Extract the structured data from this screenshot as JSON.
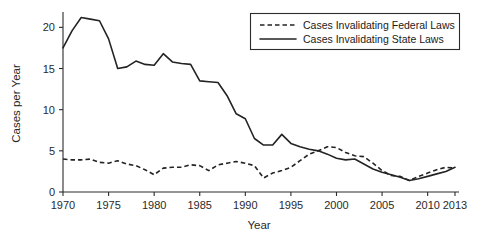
{
  "chart_data": {
    "type": "line",
    "title": "",
    "xlabel": "Year",
    "ylabel": "Cases per Year",
    "xlim": [
      1970,
      2013
    ],
    "ylim": [
      0,
      21.5
    ],
    "grid": false,
    "legend_position": "top-right",
    "x": [
      1970,
      1971,
      1972,
      1973,
      1974,
      1975,
      1976,
      1977,
      1978,
      1979,
      1980,
      1981,
      1982,
      1983,
      1984,
      1985,
      1986,
      1987,
      1988,
      1989,
      1990,
      1991,
      1992,
      1993,
      1994,
      1995,
      1996,
      1997,
      1998,
      1999,
      2000,
      2001,
      2002,
      2003,
      2004,
      2005,
      2006,
      2007,
      2008,
      2009,
      2010,
      2011,
      2012,
      2013
    ],
    "xticks": [
      1970,
      1975,
      1980,
      1985,
      1990,
      1995,
      2000,
      2005,
      2010,
      2013
    ],
    "xtick_labels": [
      "1970",
      "1975",
      "1980",
      "1985",
      "1990",
      "1995",
      "2000",
      "2005",
      "2010",
      "2013"
    ],
    "yticks": [
      0,
      5,
      10,
      15,
      20
    ],
    "ytick_labels": [
      "0",
      "5",
      "10",
      "15",
      "20"
    ],
    "series": [
      {
        "name": "Cases Invalidating Federal Laws",
        "style": "dashed",
        "values": [
          4.0,
          3.9,
          3.9,
          4.0,
          3.6,
          3.5,
          3.8,
          3.4,
          3.2,
          2.7,
          2.1,
          2.9,
          3.0,
          3.0,
          3.3,
          3.2,
          2.6,
          3.3,
          3.5,
          3.7,
          3.5,
          3.2,
          1.7,
          2.3,
          2.6,
          3.0,
          3.8,
          4.6,
          5.0,
          5.5,
          5.4,
          4.8,
          4.4,
          4.3,
          3.5,
          2.6,
          2.0,
          1.9,
          1.4,
          1.9,
          2.3,
          2.7,
          3.0,
          2.9
        ]
      },
      {
        "name": "Cases Invalidating State Laws",
        "style": "solid",
        "values": [
          17.5,
          19.6,
          21.2,
          21.0,
          20.8,
          18.6,
          15.0,
          15.2,
          15.9,
          15.5,
          15.4,
          16.8,
          15.8,
          15.6,
          15.5,
          13.5,
          13.4,
          13.3,
          11.7,
          9.5,
          8.9,
          6.5,
          5.7,
          5.7,
          7.0,
          5.9,
          5.5,
          5.2,
          5.0,
          4.6,
          4.1,
          3.9,
          4.0,
          3.4,
          2.8,
          2.4,
          2.1,
          1.8,
          1.4,
          1.6,
          1.9,
          2.2,
          2.5,
          3.0
        ]
      }
    ]
  },
  "legend": {
    "items": [
      {
        "label": "Cases Invalidating Federal Laws",
        "style": "dashed"
      },
      {
        "label": "Cases Invalidating State Laws",
        "style": "solid"
      }
    ]
  },
  "axes": {
    "x_title": "Year",
    "y_title": "Cases per Year"
  }
}
